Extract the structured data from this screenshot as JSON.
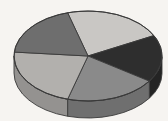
{
  "figure": {
    "kind": "3d-pie-chart",
    "background_color": "#f6f4f1",
    "outline_color": "#3a3a3a",
    "width": 168,
    "height": 121
  },
  "geometry": {
    "center_x": 88,
    "center_y": 56,
    "radius_x": 74,
    "radius_y": 45,
    "depth": 17
  },
  "chart_data": {
    "type": "pie",
    "title": "",
    "subtitle": "",
    "xlabel": "",
    "ylabel": "",
    "legend": false,
    "legend_position": "none",
    "grid": false,
    "labels": [
      "Slice 1",
      "Slice 2",
      "Slice 3",
      "Slice 4",
      "Slice 5"
    ],
    "values": [
      22,
      17,
      20,
      22,
      19
    ],
    "percentages": [
      "22%",
      "17%",
      "20%",
      "22%",
      "19%"
    ],
    "colors": [
      "#c9c7c4",
      "#2e2e2e",
      "#8a8a8a",
      "#b2b0ad",
      "#6e6e6e"
    ],
    "side_colors": [
      "#a9a7a4",
      "#242424",
      "#6f6f6f",
      "#949290",
      "#585858"
    ],
    "start_angle_deg": 254,
    "direction": "clockwise",
    "annotations": []
  },
  "slices": [
    {
      "name": "slice-top-left",
      "label": "Slice 1",
      "value": 22,
      "color": "#c9c7c4",
      "side_color": "#a9a7a4",
      "start_deg": 254,
      "end_deg": 333
    },
    {
      "name": "slice-top-right",
      "label": "Slice 2",
      "value": 17,
      "color": "#2e2e2e",
      "side_color": "#242424",
      "start_deg": 333,
      "end_deg": 394
    },
    {
      "name": "slice-right",
      "label": "Slice 3",
      "value": 20,
      "color": "#8a8a8a",
      "side_color": "#6f6f6f",
      "start_deg": 394,
      "end_deg": 466
    },
    {
      "name": "slice-bottom",
      "label": "Slice 4",
      "value": 22,
      "color": "#b2b0ad",
      "side_color": "#949290",
      "start_deg": 466,
      "end_deg": 545
    },
    {
      "name": "slice-left",
      "label": "Slice 5",
      "value": 19,
      "color": "#6e6e6e",
      "side_color": "#585858",
      "start_deg": 545,
      "end_deg": 614
    }
  ]
}
